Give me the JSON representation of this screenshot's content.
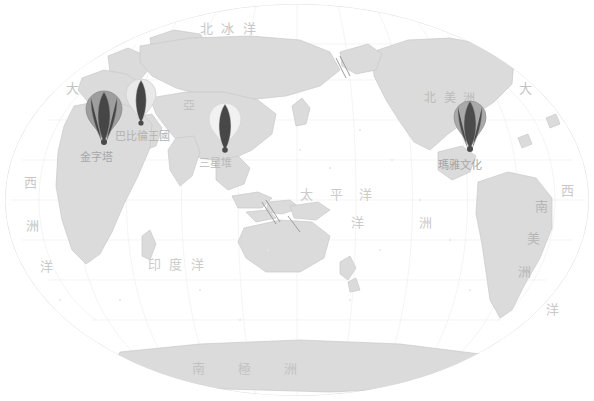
{
  "map": {
    "title": "世界古文明分布圖",
    "projection": "elliptical-world",
    "background_color": "#ffffff",
    "land_color": "#dcdcdc",
    "land_stroke": "#c8c8c8",
    "graticule_color": "#e8e8e8",
    "ocean_color": "#ffffff"
  },
  "ocean_labels": [
    {
      "name": "arctic-ocean",
      "text": "北  冰  洋",
      "x": 200,
      "y": 22,
      "size": 13,
      "color": "#c6c6c6",
      "vertical": false
    },
    {
      "name": "pacific-ocean",
      "text": "太    平    洋",
      "x": 300,
      "y": 188,
      "size": 13,
      "color": "#cbcbcb",
      "vertical": false
    },
    {
      "name": "indian-ocean",
      "text": "印  度  洋",
      "x": 148,
      "y": 258,
      "size": 13,
      "color": "#cbcbcb",
      "vertical": false
    },
    {
      "name": "atlantic-ocean-west",
      "text": "西",
      "x": 24,
      "y": 176,
      "size": 13,
      "color": "#c9c9c9",
      "vertical": false
    },
    {
      "name": "atlantic-ocean-west-2",
      "text": "洋",
      "x": 40,
      "y": 260,
      "size": 13,
      "color": "#c9c9c9",
      "vertical": false
    },
    {
      "name": "atlantic-ocean-east",
      "text": "西",
      "x": 561,
      "y": 184,
      "size": 13,
      "color": "#c9c9c9",
      "vertical": false
    },
    {
      "name": "atlantic-ocean-east-2",
      "text": "洋",
      "x": 546,
      "y": 303,
      "size": 13,
      "color": "#c9c9c9",
      "vertical": false
    }
  ],
  "continent_labels": [
    {
      "name": "europe-da",
      "text": "大",
      "x": 66,
      "y": 82,
      "size": 13,
      "color": "#c3c3c3"
    },
    {
      "name": "africa-zhou",
      "text": "洲",
      "x": 26,
      "y": 219,
      "size": 13,
      "color": "#c5c5c5"
    },
    {
      "name": "asia",
      "text": "亞",
      "x": 183,
      "y": 100,
      "size": 12,
      "color": "#c0c0c0"
    },
    {
      "name": "north-america",
      "text": "北  美  洲",
      "x": 424,
      "y": 92,
      "size": 12,
      "color": "#bcbcbc"
    },
    {
      "name": "pacific-da",
      "text": "大",
      "x": 519,
      "y": 82,
      "size": 13,
      "color": "#c3c3c3"
    },
    {
      "name": "oceania-yang",
      "text": "洋",
      "x": 351,
      "y": 216,
      "size": 13,
      "color": "#cacaca"
    },
    {
      "name": "oceania-zhou",
      "text": "洲",
      "x": 419,
      "y": 216,
      "size": 13,
      "color": "#cacaca"
    },
    {
      "name": "south-america-nan",
      "text": "南",
      "x": 535,
      "y": 200,
      "size": 13,
      "color": "#b6b6b6"
    },
    {
      "name": "south-america-mei",
      "text": "美",
      "x": 527,
      "y": 232,
      "size": 13,
      "color": "#b6b6b6"
    },
    {
      "name": "south-america-zhou",
      "text": "洲",
      "x": 518,
      "y": 265,
      "size": 13,
      "color": "#b6b6b6"
    },
    {
      "name": "antarctica",
      "text": "南        極        洲",
      "x": 192,
      "y": 362,
      "size": 13,
      "color": "#c2c2c2"
    }
  ],
  "markers": [
    {
      "name": "marker-pyramids",
      "label": "金字塔",
      "site": "Pyramids of Giza",
      "x": 104,
      "y": 90,
      "width": 40,
      "height": 58,
      "fill": "#9e9e9e",
      "stroke": "#8a8a8a",
      "label_x": 80,
      "label_y": 148,
      "label_color": "#a8a8a8",
      "highlight": true
    },
    {
      "name": "marker-babylon",
      "label": "巴比倫王國",
      "site": "Babylonian Kingdom",
      "x": 141,
      "y": 78,
      "width": 34,
      "height": 50,
      "fill": "#e2e2e2",
      "stroke": "#cccccc",
      "label_x": 115,
      "label_y": 128,
      "label_color": "#b8b8b8",
      "highlight": false
    },
    {
      "name": "marker-sanxingdui",
      "label": "三星堆",
      "site": "Sanxingdui",
      "x": 208,
      "y": 103,
      "width": 36,
      "height": 52,
      "fill": "#ececec",
      "stroke": "#d2d2d2",
      "label_x": 198,
      "label_y": 155,
      "label_color": "#bdbdbd",
      "highlight": false
    },
    {
      "name": "marker-maya",
      "label": "瑪雅文化",
      "site": "Maya Culture",
      "x": 455,
      "y": 100,
      "width": 36,
      "height": 54,
      "fill": "#a8a8a8",
      "stroke": "#949494",
      "label_x": 437,
      "label_y": 157,
      "label_color": "#a8a8a8",
      "highlight": true
    }
  ],
  "legend": {
    "visible": false,
    "items": []
  }
}
